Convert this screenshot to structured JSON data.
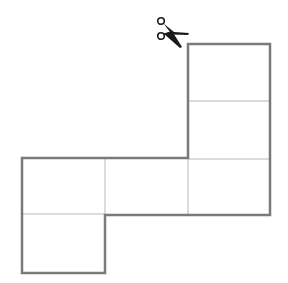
{
  "diagram": {
    "title": "",
    "outline_color": "#7a7a7a",
    "inner_line_color": "#b8b8b8",
    "scissors_color": "#1a1a1a",
    "icon": "scissors-icon",
    "faces": 6
  }
}
